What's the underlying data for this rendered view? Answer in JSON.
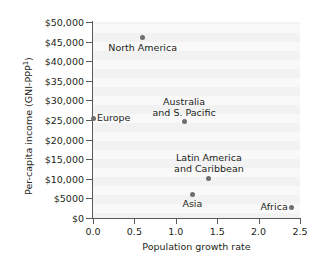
{
  "chart_data": {
    "type": "scatter",
    "title": "",
    "xlabel": "Population growth rate",
    "ylabel": "Per-capita income (GNI-PPP",
    "ylabel_superscript": "1",
    "ylabel_suffix": ")",
    "xlim": [
      0.0,
      2.5
    ],
    "ylim": [
      0,
      50000
    ],
    "grid": false,
    "legend": "none",
    "xticks": [
      "0.0",
      "0.5",
      "1.0",
      "1.5",
      "2.0",
      "2.5"
    ],
    "xtick_values": [
      0.0,
      0.5,
      1.0,
      1.5,
      2.0,
      2.5
    ],
    "yticks": [
      "$0",
      "$5000",
      "$10,000",
      "$15,000",
      "$20,000",
      "$25,000",
      "$30,000",
      "$35,000",
      "$40,000",
      "$45,000",
      "$50,000"
    ],
    "ytick_values": [
      0,
      5000,
      10000,
      15000,
      20000,
      25000,
      30000,
      35000,
      40000,
      45000,
      50000
    ],
    "points": [
      {
        "label": "North America",
        "x": 0.6,
        "y": 46000,
        "label_pos": "below-center"
      },
      {
        "label": "Europe",
        "x": 0.0,
        "y": 25500,
        "label_pos": "right"
      },
      {
        "label": "Australia\nand S. Pacific",
        "line1": "Australia",
        "line2": "and S. Pacific",
        "x": 1.1,
        "y": 24500,
        "label_pos": "above-center"
      },
      {
        "label": "Latin America\nand Caribbean",
        "line1": "Latin America",
        "line2": "and Caribbean",
        "x": 1.4,
        "y": 10200,
        "label_pos": "above-center"
      },
      {
        "label": "Asia",
        "x": 1.2,
        "y": 6100,
        "label_pos": "below-center"
      },
      {
        "label": "Africa",
        "x": 2.4,
        "y": 2700,
        "label_pos": "left"
      }
    ],
    "marker_color": "#6d6e71",
    "axis_color": "#58595b",
    "plot_background": "#f2f2f2",
    "text_color": "#231f20"
  }
}
